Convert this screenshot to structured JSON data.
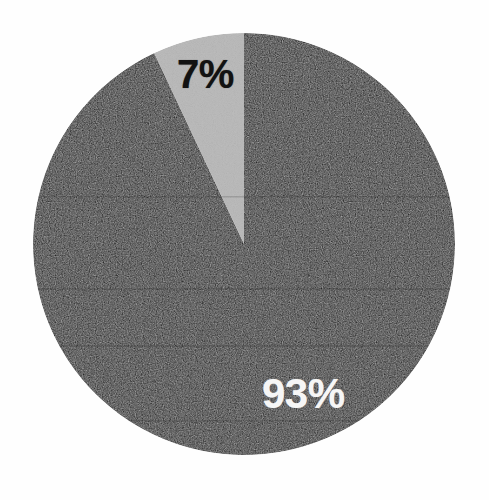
{
  "chart_data": {
    "type": "pie",
    "title": "",
    "subtitle": "",
    "xlabel": "",
    "ylabel": "",
    "legend_position": "none",
    "grid": false,
    "unit": "%",
    "total": 100,
    "categories": [
      "93%",
      "7%"
    ],
    "values": [
      93,
      7
    ],
    "labels": [
      "93%",
      "7%"
    ],
    "start_angle_deg": 0,
    "direction": "counterclockwise",
    "slices": [
      {
        "label": "93%",
        "value": 93,
        "percent": 93,
        "color": "#121212",
        "label_color": "#f6f6f6",
        "start_angle_deg": 0,
        "sweep_angle_deg": 334.8,
        "label_x": 262,
        "label_y": 373
      },
      {
        "label": "7%",
        "value": 7,
        "percent": 7,
        "color": "#bcbcbc",
        "label_color": "#121212",
        "start_angle_deg": 334.8,
        "sweep_angle_deg": 25.2,
        "label_x": 177,
        "label_y": 54
      }
    ],
    "geometry": {
      "center_x": 244,
      "center_y": 244,
      "radius": 211
    },
    "colors": {
      "background": "#fefefe",
      "dark_slice": "#121212",
      "light_slice": "#bcbcbc",
      "dark_label_text": "#f6f6f6",
      "light_label_text": "#121212"
    }
  }
}
